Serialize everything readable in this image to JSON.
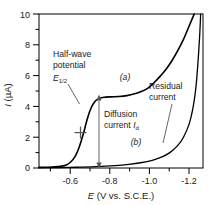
{
  "chart_data": {
    "type": "line",
    "title": "",
    "xlabel": "E (V vs. S.C.E.)",
    "ylabel": "I (µA)",
    "xlabel_italic_part": "E",
    "xlabel_rest": " (V vs. S.C.E.)",
    "ylabel_italic_part": "I",
    "ylabel_rest": " (µA)",
    "xlim": [
      -0.46,
      -1.3
    ],
    "ylim": [
      0,
      10
    ],
    "x_ticks": [
      -0.6,
      -0.8,
      -1.0,
      -1.2
    ],
    "x_tick_labels": [
      "-0.6",
      "-0.8",
      "-1.0",
      "-1.2"
    ],
    "x_minor_ticks": [
      -0.5,
      -0.7,
      -0.9,
      -1.1,
      -1.3
    ],
    "y_ticks": [
      0,
      2,
      4,
      6,
      8,
      10
    ],
    "y_tick_labels": [
      "0",
      "2",
      "4",
      "6",
      "8",
      "10"
    ],
    "y_minor_ticks": [
      1,
      3,
      5,
      7,
      9
    ],
    "grid": false,
    "legend": "inline curve labels",
    "series": [
      {
        "name": "(a)",
        "description": "polarographic wave with diffusion plateau",
        "label_x": -0.905,
        "label_y": 5.35,
        "points": [
          [
            -0.46,
            0.04
          ],
          [
            -0.5,
            0.05
          ],
          [
            -0.54,
            0.07
          ],
          [
            -0.57,
            0.11
          ],
          [
            -0.6,
            0.2
          ],
          [
            -0.625,
            0.42
          ],
          [
            -0.645,
            0.75
          ],
          [
            -0.66,
            1.15
          ],
          [
            -0.675,
            1.7
          ],
          [
            -0.69,
            2.35
          ],
          [
            -0.7,
            2.85
          ],
          [
            -0.71,
            3.3
          ],
          [
            -0.725,
            3.85
          ],
          [
            -0.74,
            4.2
          ],
          [
            -0.755,
            4.42
          ],
          [
            -0.775,
            4.55
          ],
          [
            -0.8,
            4.6
          ],
          [
            -0.83,
            4.62
          ],
          [
            -0.87,
            4.64
          ],
          [
            -0.91,
            4.7
          ],
          [
            -0.95,
            4.82
          ],
          [
            -0.99,
            5.0
          ],
          [
            -1.02,
            5.2
          ],
          [
            -1.05,
            5.55
          ],
          [
            -1.08,
            5.95
          ],
          [
            -1.11,
            6.4
          ],
          [
            -1.14,
            6.95
          ],
          [
            -1.17,
            7.6
          ],
          [
            -1.2,
            8.35
          ],
          [
            -1.225,
            9.1
          ],
          [
            -1.245,
            9.7
          ],
          [
            -1.255,
            10.0
          ]
        ]
      },
      {
        "name": "(b)",
        "description": "residual current curve",
        "label_x": -0.995,
        "label_y": 1.05,
        "points": [
          [
            -0.46,
            0.02
          ],
          [
            -0.55,
            0.03
          ],
          [
            -0.65,
            0.05
          ],
          [
            -0.75,
            0.09
          ],
          [
            -0.85,
            0.16
          ],
          [
            -0.92,
            0.24
          ],
          [
            -0.98,
            0.34
          ],
          [
            -1.04,
            0.5
          ],
          [
            -1.09,
            0.72
          ],
          [
            -1.13,
            1.0
          ],
          [
            -1.17,
            1.45
          ],
          [
            -1.2,
            2.0
          ],
          [
            -1.23,
            2.9
          ],
          [
            -1.25,
            4.0
          ],
          [
            -1.265,
            5.4
          ],
          [
            -1.275,
            7.0
          ],
          [
            -1.283,
            8.6
          ],
          [
            -1.288,
            10.0
          ]
        ]
      }
    ],
    "annotations": [
      {
        "name": "half-wave-potential",
        "line1": "Half-wave",
        "line2": "potential",
        "symbol": "E",
        "symbol_sub": "1/2",
        "pointer_from": [
          -0.645,
          4.75
        ],
        "pointer_to": [
          -0.702,
          2.45
        ],
        "marker": "cross",
        "marker_x": -0.702,
        "marker_y": 2.3
      },
      {
        "name": "diffusion-current",
        "line1": "Diffusion",
        "line2": "current",
        "symbol": "I",
        "symbol_sub": "d",
        "arrow_x": -0.845,
        "arrow_top": 4.55,
        "arrow_bottom": 0.18
      },
      {
        "name": "residual-current",
        "line1": "Residual",
        "line2": "current",
        "pointer_from": [
          -1.095,
          2.15
        ],
        "pointer_to": [
          -1.155,
          0.95
        ]
      }
    ],
    "colors": {
      "curve": "#000000",
      "axis": "#000000",
      "text": "#1a1a1a",
      "annotation_line": "#555555",
      "background": "#ffffff"
    }
  }
}
